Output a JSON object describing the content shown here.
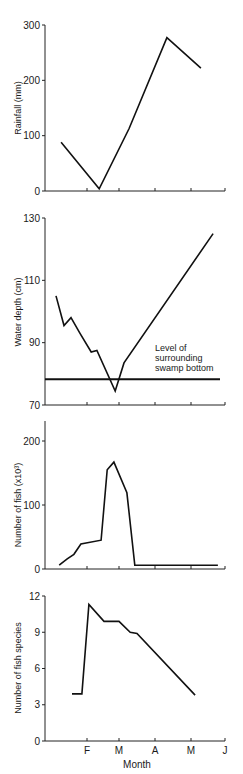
{
  "figure": {
    "x_axis": {
      "label": "Month",
      "tick_labels": [
        "F",
        "M",
        "A",
        "M",
        "J"
      ],
      "tick_values": [
        1,
        2,
        3,
        4,
        5
      ]
    }
  },
  "chart_data": [
    {
      "type": "line",
      "title": "",
      "xlabel": "",
      "ylabel": "Rainfall (mm)",
      "ylim": [
        0,
        300
      ],
      "yticks": [
        0,
        100,
        200,
        300
      ],
      "x_unit": "month index (F=1, M=2, A=3, M=4, J=5)",
      "x": [
        0.19,
        1.38,
        2.28,
        3.33,
        4.29
      ],
      "values": [
        88,
        4,
        113,
        277,
        222
      ],
      "grid": false
    },
    {
      "type": "line",
      "title": "",
      "xlabel": "",
      "ylabel": "Water depth (cm)",
      "ylim": [
        70,
        130
      ],
      "yticks": [
        70,
        90,
        110,
        130
      ],
      "x_unit": "month index (F=1, M=2, A=3, M=4, J=5)",
      "x": [
        0.03,
        0.28,
        0.5,
        0.78,
        1.13,
        1.31,
        1.88,
        2.14,
        4.65
      ],
      "values": [
        105,
        95.5,
        98,
        93,
        87,
        87.5,
        74.5,
        83.5,
        125
      ],
      "reference_line": {
        "value": 78.3,
        "label": [
          "Level of",
          "surrounding",
          "swamp bottom"
        ]
      },
      "grid": false
    },
    {
      "type": "line",
      "title": "",
      "xlabel": "",
      "ylabel": "Number of fish (x10³)",
      "ylim": [
        0,
        230
      ],
      "yticks": [
        0,
        100,
        200
      ],
      "x_unit": "month index (F=1, M=2, A=3, M=4, J=5)",
      "x": [
        0.13,
        0.38,
        0.59,
        0.81,
        1.44,
        1.63,
        1.84,
        2.22,
        2.44,
        4.79
      ],
      "values": [
        6,
        16,
        23,
        39,
        45,
        155,
        167,
        119,
        6,
        6
      ],
      "grid": false
    },
    {
      "type": "line",
      "title": "",
      "xlabel": "Month",
      "ylabel": "Number of fish species",
      "ylim": [
        0,
        12
      ],
      "yticks": [
        0,
        3,
        6,
        9,
        12
      ],
      "xticks": [
        "F",
        "M",
        "A",
        "M",
        "J"
      ],
      "x_unit": "month index (F=1, M=2, A=3, M=4, J=5)",
      "x": [
        0.53,
        0.84,
        1.06,
        1.53,
        2.0,
        2.31,
        2.5,
        4.12
      ],
      "values": [
        3.9,
        3.9,
        11.3,
        9.9,
        9.9,
        9.0,
        8.9,
        3.8
      ],
      "grid": false
    }
  ]
}
